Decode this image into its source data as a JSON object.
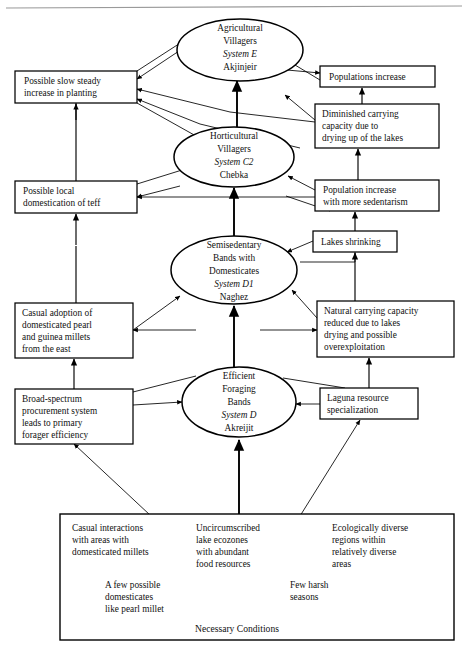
{
  "figure": {
    "title": "Necessary Conditions",
    "top_rule": true
  },
  "nodes": {
    "ellipses": [
      {
        "id": "system-e",
        "lines": [
          "Agricultural",
          "Villagers",
          "System E",
          "Akjinjeir"
        ],
        "italic_line": 2,
        "cx": 240,
        "cy": 50,
        "rx": 63,
        "ry": 31
      },
      {
        "id": "system-c2",
        "lines": [
          "Horticultural",
          "Villagers",
          "System C2",
          "Chebka"
        ],
        "italic_line": 2,
        "cx": 234,
        "cy": 157,
        "rx": 60,
        "ry": 30
      },
      {
        "id": "system-d1",
        "lines": [
          "Semisedentary",
          "Bands with",
          "Domesticates",
          "System D1",
          "Naghez"
        ],
        "italic_line": 3,
        "cx": 234,
        "cy": 270,
        "rx": 63,
        "ry": 34
      },
      {
        "id": "system-d",
        "lines": [
          "Efficient",
          "Foraging",
          "Bands",
          "System D",
          "Akreijit"
        ],
        "italic_line": 3,
        "cx": 239,
        "cy": 402,
        "rx": 57,
        "ry": 35
      }
    ],
    "boxes": [
      {
        "id": "slow-steady-planting",
        "lines": [
          "Possible slow steady",
          "increase in planting"
        ],
        "x": 15,
        "y": 71,
        "w": 122,
        "h": 32
      },
      {
        "id": "populations-increase",
        "lines": [
          "Populations increase"
        ],
        "x": 320,
        "y": 66,
        "w": 115,
        "h": 21
      },
      {
        "id": "diminished-carrying-capacity",
        "lines": [
          "Diminished carrying",
          "capacity due to",
          "drying up of the lakes"
        ],
        "x": 315,
        "y": 104,
        "w": 124,
        "h": 44
      },
      {
        "id": "local-domestication-teff",
        "lines": [
          "Possible local",
          "domestication of teff"
        ],
        "x": 15,
        "y": 181,
        "w": 122,
        "h": 32
      },
      {
        "id": "population-increase-sedentarism",
        "lines": [
          "Population increase",
          "with more sedentarism"
        ],
        "x": 315,
        "y": 180,
        "w": 124,
        "h": 31
      },
      {
        "id": "lakes-shrinking",
        "lines": [
          "Lakes shrinking"
        ],
        "x": 313,
        "y": 231,
        "w": 84,
        "h": 21
      },
      {
        "id": "casual-adoption-millets",
        "lines": [
          "Casual adoption of",
          "domesticated pearl",
          "and guinea millets",
          "from the east"
        ],
        "x": 15,
        "y": 303,
        "w": 118,
        "h": 55
      },
      {
        "id": "natural-carrying-capacity",
        "lines": [
          "Natural carrying capacity",
          "reduced due to lakes",
          "drying and possible",
          "overexploitation"
        ],
        "x": 317,
        "y": 301,
        "w": 137,
        "h": 56
      },
      {
        "id": "broad-spectrum-procurement",
        "lines": [
          "Broad-spectrum",
          "procurement system",
          "leads to primary",
          "forager efficiency"
        ],
        "x": 15,
        "y": 389,
        "w": 118,
        "h": 55
      },
      {
        "id": "laguna-resource-specialization",
        "lines": [
          "Laguna resource",
          "specialization"
        ],
        "x": 320,
        "y": 388,
        "w": 98,
        "h": 31
      }
    ],
    "conditions_box": {
      "id": "necessary-conditions",
      "x": 60,
      "y": 514,
      "w": 394,
      "h": 126,
      "columns": [
        {
          "id": "cond-casual-interactions",
          "lines": [
            "Casual interactions",
            "with areas with",
            "domesticated millets"
          ],
          "x": 72,
          "y": 531
        },
        {
          "id": "cond-uncircumscribed-lakes",
          "lines": [
            "Uncircumscribed",
            "lake ecozones",
            "with abundant",
            "food resources"
          ],
          "x": 196,
          "y": 531
        },
        {
          "id": "cond-ecologically-diverse",
          "lines": [
            "Ecologically diverse",
            "regions within",
            "relatively diverse",
            "areas"
          ],
          "x": 332,
          "y": 531
        },
        {
          "id": "cond-few-domesticates",
          "lines": [
            "A few possible",
            "domesticates",
            "like pearl millet"
          ],
          "x": 105,
          "y": 588
        },
        {
          "id": "cond-few-harsh-seasons",
          "lines": [
            "Few harsh",
            "seasons"
          ],
          "x": 290,
          "y": 588
        }
      ],
      "caption": "Necessary Conditions",
      "caption_x": 195,
      "caption_y": 632
    }
  }
}
